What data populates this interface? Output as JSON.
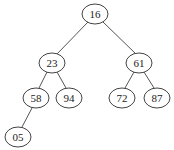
{
  "diagram": {
    "type": "binary-tree",
    "colors": {
      "background": "#ffffff",
      "edge": "#555555",
      "node_stroke": "#444444",
      "node_fill": "#ffffff",
      "text": "#222222"
    },
    "nodes": [
      {
        "id": "n16",
        "label": "16",
        "cx": 95,
        "cy": 14,
        "rx": 13,
        "ry": 10
      },
      {
        "id": "n23",
        "label": "23",
        "cx": 52,
        "cy": 63,
        "rx": 13,
        "ry": 10
      },
      {
        "id": "n61",
        "label": "61",
        "cx": 139,
        "cy": 63,
        "rx": 13,
        "ry": 10
      },
      {
        "id": "n58",
        "label": "58",
        "cx": 36,
        "cy": 98,
        "rx": 13,
        "ry": 10
      },
      {
        "id": "n94",
        "label": "94",
        "cx": 69,
        "cy": 98,
        "rx": 13,
        "ry": 10
      },
      {
        "id": "n72",
        "label": "72",
        "cx": 122,
        "cy": 98,
        "rx": 13,
        "ry": 10
      },
      {
        "id": "n87",
        "label": "87",
        "cx": 157,
        "cy": 98,
        "rx": 13,
        "ry": 10
      },
      {
        "id": "n05",
        "label": "05",
        "cx": 18,
        "cy": 137,
        "rx": 13,
        "ry": 10
      }
    ],
    "edges": [
      {
        "from": "n16",
        "to": "n23",
        "x1": 88,
        "y1": 22,
        "x2": 57,
        "y2": 54
      },
      {
        "from": "n16",
        "to": "n61",
        "x1": 103,
        "y1": 22,
        "x2": 136,
        "y2": 54
      },
      {
        "from": "n23",
        "to": "n58",
        "x1": 47,
        "y1": 72,
        "x2": 39,
        "y2": 88
      },
      {
        "from": "n23",
        "to": "n94",
        "x1": 57,
        "y1": 72,
        "x2": 66,
        "y2": 88
      },
      {
        "from": "n61",
        "to": "n72",
        "x1": 134,
        "y1": 72,
        "x2": 125,
        "y2": 88
      },
      {
        "from": "n61",
        "to": "n87",
        "x1": 144,
        "y1": 72,
        "x2": 154,
        "y2": 88
      },
      {
        "from": "n58",
        "to": "n05",
        "x1": 32,
        "y1": 108,
        "x2": 22,
        "y2": 127
      }
    ]
  }
}
